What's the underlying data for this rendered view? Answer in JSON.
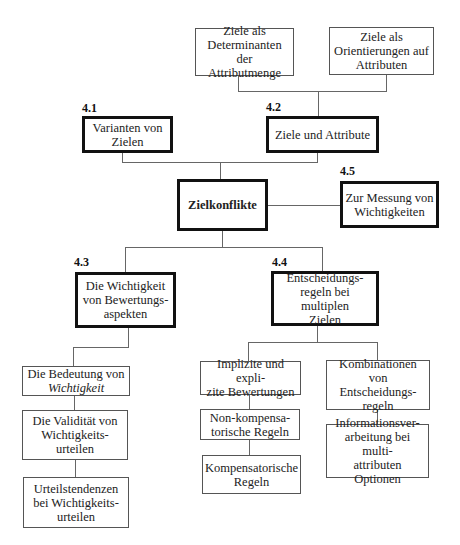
{
  "diagram": {
    "top": {
      "determinanten": "Ziele als\nDeterminanten der\nAttributmenge",
      "orientierungen": "Ziele als\nOrientierungen auf\nAttributen"
    },
    "sections": {
      "s41": {
        "number": "4.1",
        "title": "Varianten von\nZielen"
      },
      "s42": {
        "number": "4.2",
        "title": "Ziele und Attribute"
      },
      "center": {
        "title": "Zielkonflikte"
      },
      "s45": {
        "number": "4.5",
        "title": "Zur Messung von\nWichtigkeiten"
      },
      "s43": {
        "number": "4.3",
        "title": "Die Wichtigkeit\nvon Bewertungs-\naspekten"
      },
      "s44": {
        "number": "4.4",
        "title": "Entscheidungs-\nregeln bei multiplen\nZielen"
      }
    },
    "left_branch": {
      "bedeutung_line1": "Die Bedeutung von",
      "bedeutung_line2_italic": "Wichtigkeit",
      "validitaet": "Die Validität von\nWichtigkeits-\nurteilen",
      "urteilstendenzen": "Urteilstendenzen\nbei Wichtigkeits-\nurteilen"
    },
    "right_branch": {
      "implizite": "Implizite und expli-\nzite Bewertungen",
      "nonkomp": "Non-kompensa-\ntorische Regeln",
      "komp": "Kompensatorische\nRegeln",
      "kombinationen": "Kombinationen von\nEntscheidungs-\nregeln",
      "informationsverarbeitung": "Informationsver-\narbeitung bei multi-\nattributen Optionen"
    }
  }
}
